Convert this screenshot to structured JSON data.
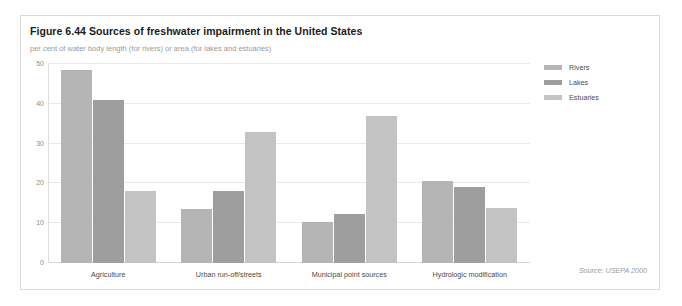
{
  "figure": {
    "title": "Figure 6.44 Sources of freshwater impairment in the United States",
    "subtitle": "per cent of water body length (for rivers) or area (for lakes and estuaries)",
    "source_note": "Source: USEPA 2000"
  },
  "legend": {
    "position": "right",
    "items": [
      {
        "label": "Rivers",
        "color": "#b5b5b5"
      },
      {
        "label": "Lakes",
        "color": "#9e9e9e"
      },
      {
        "label": "Estuaries",
        "color": "#c3c3c3"
      }
    ]
  },
  "colors": {
    "frame_border": "#d9d9d9",
    "gridline": "#e9e9e9",
    "axis": "#dddddd",
    "title_text": "#1b1b1b",
    "subtitle_text": "#9a9a9a",
    "tick_text": "#8d8d8d",
    "category_text": "#4a4a4a",
    "source_text": "#9b9b9b"
  },
  "chart_data": {
    "type": "bar",
    "title": "Figure 6.44 Sources of freshwater impairment in the United States",
    "subtitle": "per cent of water body length (for rivers) or area (for lakes and estuaries)",
    "xlabel": "",
    "ylabel": "",
    "ylim": [
      0,
      50
    ],
    "yticks": [
      0,
      10,
      20,
      30,
      40,
      50
    ],
    "ytick_labels": [
      "0",
      "10",
      "20",
      "30",
      "40",
      "50"
    ],
    "grid": true,
    "legend_position": "right",
    "source": "Source: USEPA 2000",
    "categories": [
      "Agriculture",
      "Urban run-off/streets",
      "Municipal point sources",
      "Hydrologic modification"
    ],
    "series": [
      {
        "name": "Rivers",
        "color": "#b5b5b5",
        "values": [
          48.5,
          13.5,
          10.3,
          20.5
        ]
      },
      {
        "name": "Lakes",
        "color": "#9e9e9e",
        "values": [
          41.0,
          18.0,
          12.3,
          19.0
        ]
      },
      {
        "name": "Estuaries",
        "color": "#c3c3c3",
        "values": [
          18.0,
          33.0,
          37.0,
          13.7
        ]
      }
    ]
  }
}
